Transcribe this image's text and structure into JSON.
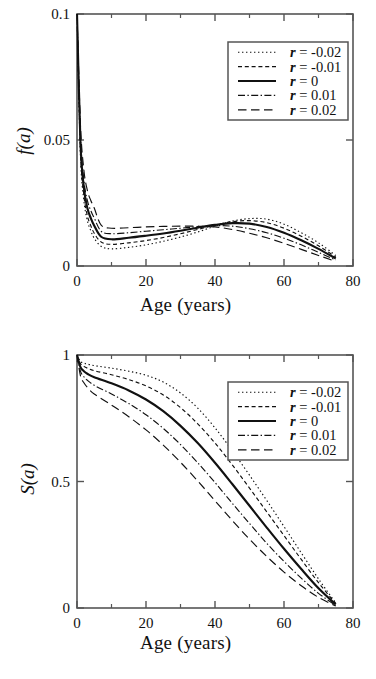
{
  "figure": {
    "panels": [
      {
        "id": "top",
        "ylabel": "f(a)",
        "xlabel": "Age (years)",
        "y_ticks": [
          "0",
          "0.05",
          "0.1"
        ],
        "x_ticks": [
          "0",
          "20",
          "40",
          "60",
          "80"
        ]
      },
      {
        "id": "bottom",
        "ylabel": "S(a)",
        "xlabel": "Age (years)",
        "y_ticks": [
          "0",
          "0.5",
          "1"
        ],
        "x_ticks": [
          "0",
          "20",
          "40",
          "60",
          "80"
        ]
      }
    ],
    "legend": {
      "entries": [
        {
          "label": "r = -0.02",
          "style": "dotted",
          "r": -0.02
        },
        {
          "label": "r = -0.01",
          "style": "dashed",
          "r": -0.01
        },
        {
          "label": "r = 0",
          "style": "solid",
          "r": 0
        },
        {
          "label": "r = 0.01",
          "style": "dashdot",
          "r": 0.01
        },
        {
          "label": "r = 0.02",
          "style": "longdash",
          "r": 0.02
        }
      ]
    },
    "colors": {
      "ink": "#111111",
      "frame": "#555555",
      "background": "#ffffff"
    }
  },
  "chart_data": [
    {
      "type": "line",
      "id": "age-density",
      "title": "",
      "xlabel": "Age (years)",
      "ylabel": "f(a)",
      "xlim": [
        0,
        80
      ],
      "ylim": [
        0,
        0.1
      ],
      "xticks": [
        0,
        20,
        40,
        60,
        80
      ],
      "yticks": [
        0,
        0.05,
        0.1
      ],
      "grid": false,
      "legend_position": "top-right",
      "x": [
        0,
        1,
        2,
        3,
        4,
        5,
        7,
        10,
        15,
        20,
        25,
        30,
        35,
        40,
        45,
        50,
        55,
        60,
        65,
        70,
        75
      ],
      "series": [
        {
          "name": "r = -0.02",
          "style": "dotted",
          "values": [
            0.1,
            0.044,
            0.026,
            0.018,
            0.014,
            0.011,
            0.0078,
            0.0068,
            0.0074,
            0.0084,
            0.0098,
            0.0115,
            0.0135,
            0.0158,
            0.0178,
            0.0188,
            0.0186,
            0.0166,
            0.0132,
            0.0092,
            0.0042
          ]
        },
        {
          "name": "r = -0.01",
          "style": "dashed",
          "values": [
            0.1,
            0.046,
            0.028,
            0.02,
            0.016,
            0.013,
            0.0095,
            0.0086,
            0.0092,
            0.0101,
            0.0113,
            0.0128,
            0.0145,
            0.0162,
            0.0176,
            0.018,
            0.0172,
            0.015,
            0.0118,
            0.008,
            0.0036
          ]
        },
        {
          "name": "r = 0",
          "style": "solid",
          "values": [
            0.1,
            0.049,
            0.031,
            0.023,
            0.019,
            0.016,
            0.0116,
            0.0106,
            0.0112,
            0.012,
            0.0129,
            0.014,
            0.0152,
            0.0163,
            0.017,
            0.0168,
            0.0155,
            0.0132,
            0.0102,
            0.0068,
            0.003
          ]
        },
        {
          "name": "r = 0.01",
          "style": "dashdot",
          "values": [
            0.1,
            0.052,
            0.034,
            0.026,
            0.022,
            0.019,
            0.0138,
            0.0128,
            0.0132,
            0.0138,
            0.0144,
            0.015,
            0.0156,
            0.016,
            0.0158,
            0.0148,
            0.0132,
            0.011,
            0.0084,
            0.0054,
            0.0024
          ]
        },
        {
          "name": "r = 0.02",
          "style": "longdash",
          "values": [
            0.1,
            0.056,
            0.038,
            0.03,
            0.026,
            0.023,
            0.0162,
            0.015,
            0.0152,
            0.0155,
            0.0157,
            0.0158,
            0.0158,
            0.0155,
            0.0145,
            0.013,
            0.0112,
            0.009,
            0.0066,
            0.0042,
            0.0018
          ]
        }
      ]
    },
    {
      "type": "line",
      "id": "survivorship",
      "title": "",
      "xlabel": "Age (years)",
      "ylabel": "S(a)",
      "xlim": [
        0,
        80
      ],
      "ylim": [
        0,
        1
      ],
      "xticks": [
        0,
        20,
        40,
        60,
        80
      ],
      "yticks": [
        0,
        0.5,
        1
      ],
      "grid": false,
      "legend_position": "top-right",
      "x": [
        0,
        1,
        2,
        3,
        5,
        10,
        15,
        20,
        25,
        30,
        35,
        40,
        45,
        50,
        55,
        60,
        65,
        70,
        75
      ],
      "series": [
        {
          "name": "r = -0.02",
          "style": "dotted",
          "values": [
            1.0,
            0.975,
            0.968,
            0.964,
            0.958,
            0.948,
            0.936,
            0.92,
            0.893,
            0.85,
            0.79,
            0.712,
            0.622,
            0.525,
            0.425,
            0.322,
            0.218,
            0.115,
            0.02
          ]
        },
        {
          "name": "r = -0.01",
          "style": "dashed",
          "values": [
            1.0,
            0.966,
            0.955,
            0.948,
            0.938,
            0.922,
            0.903,
            0.878,
            0.842,
            0.792,
            0.728,
            0.652,
            0.566,
            0.474,
            0.38,
            0.286,
            0.192,
            0.1,
            0.018
          ]
        },
        {
          "name": "r = 0",
          "style": "solid",
          "values": [
            1.0,
            0.952,
            0.936,
            0.926,
            0.912,
            0.888,
            0.86,
            0.824,
            0.778,
            0.72,
            0.652,
            0.574,
            0.49,
            0.404,
            0.318,
            0.234,
            0.154,
            0.078,
            0.014
          ]
        },
        {
          "name": "r = 0.01",
          "style": "dashdot",
          "values": [
            1.0,
            0.936,
            0.914,
            0.9,
            0.88,
            0.846,
            0.808,
            0.764,
            0.71,
            0.646,
            0.574,
            0.496,
            0.414,
            0.334,
            0.256,
            0.184,
            0.118,
            0.058,
            0.01
          ]
        },
        {
          "name": "r = 0.02",
          "style": "longdash",
          "values": [
            1.0,
            0.918,
            0.89,
            0.872,
            0.846,
            0.802,
            0.756,
            0.704,
            0.644,
            0.576,
            0.502,
            0.424,
            0.346,
            0.272,
            0.204,
            0.142,
            0.088,
            0.042,
            0.008
          ]
        }
      ]
    }
  ]
}
